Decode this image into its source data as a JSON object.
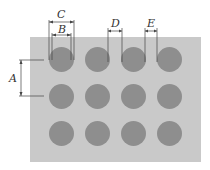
{
  "diagram": {
    "labels": {
      "A": "A",
      "B": "B",
      "C": "C",
      "D": "D",
      "E": "E"
    },
    "grid": {
      "rows": 3,
      "cols": 4,
      "hole_color": "#8e8e8e",
      "plate_color": "#c9c9c9"
    },
    "holes": [
      {
        "x": 49,
        "y": 47
      },
      {
        "x": 85,
        "y": 47
      },
      {
        "x": 121,
        "y": 47
      },
      {
        "x": 157,
        "y": 47
      },
      {
        "x": 49,
        "y": 84
      },
      {
        "x": 85,
        "y": 84
      },
      {
        "x": 121,
        "y": 84
      },
      {
        "x": 157,
        "y": 84
      },
      {
        "x": 49,
        "y": 121
      },
      {
        "x": 85,
        "y": 121
      },
      {
        "x": 121,
        "y": 121
      },
      {
        "x": 157,
        "y": 121
      }
    ]
  }
}
